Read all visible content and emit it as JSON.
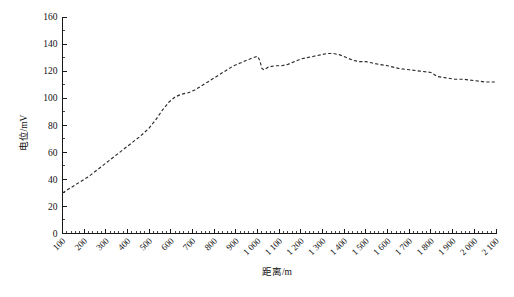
{
  "figure": {
    "background_color": "#ffffff",
    "line_color": "#2b2b2b",
    "axis_color": "#1a1a1a",
    "y_axis_title": "电位/mV",
    "x_axis_title": "距离/m"
  },
  "chart_data": {
    "type": "line",
    "title": "",
    "subtitle": "",
    "xlabel": "距离/m",
    "ylabel": "电位/mV",
    "xlim": [
      100,
      2100
    ],
    "ylim": [
      0,
      160
    ],
    "grid": false,
    "legend": null,
    "legend_position": "none",
    "line_style": "dashed",
    "x_tick_labels": [
      "100",
      "200",
      "300",
      "400",
      "500",
      "600",
      "700",
      "800",
      "900",
      "1 000",
      "1 100",
      "1 200",
      "1 300",
      "1 400",
      "1 500",
      "1 600",
      "1 700",
      "1 800",
      "1 900",
      "2 000",
      "2 100"
    ],
    "x_tick_values": [
      100,
      200,
      300,
      400,
      500,
      600,
      700,
      800,
      900,
      1000,
      1100,
      1200,
      1300,
      1400,
      1500,
      1600,
      1700,
      1800,
      1900,
      2000,
      2100
    ],
    "x_tick_rotation": 45,
    "x_minor_tick_interval": 20,
    "y_tick_labels": [
      "0",
      "20",
      "40",
      "60",
      "80",
      "100",
      "120",
      "140",
      "160"
    ],
    "y_tick_values": [
      0,
      20,
      40,
      60,
      80,
      100,
      120,
      140,
      160
    ],
    "y_minor_tick_interval": 10,
    "series": [
      {
        "name": "电位",
        "x": [
          100,
          140,
          180,
          220,
          260,
          300,
          340,
          380,
          420,
          460,
          500,
          530,
          560,
          590,
          620,
          650,
          680,
          710,
          740,
          770,
          800,
          830,
          860,
          890,
          920,
          950,
          980,
          1000,
          1010,
          1020,
          1030,
          1050,
          1080,
          1110,
          1140,
          1170,
          1200,
          1230,
          1260,
          1290,
          1320,
          1350,
          1380,
          1410,
          1440,
          1470,
          1500,
          1530,
          1560,
          1600,
          1650,
          1700,
          1750,
          1800,
          1830,
          1870,
          1910,
          1950,
          2000,
          2050,
          2100
        ],
        "y": [
          30,
          34,
          38,
          42,
          47,
          52,
          57,
          62,
          67,
          72,
          78,
          84,
          91,
          97,
          101,
          103,
          104,
          106,
          109,
          112,
          115,
          118,
          121,
          124,
          126,
          128,
          130,
          131,
          128,
          122,
          121,
          123,
          124,
          124,
          125,
          127,
          129,
          130,
          131,
          132,
          133,
          133,
          132,
          130,
          128,
          127,
          127,
          126,
          125,
          124,
          122,
          121,
          120,
          119,
          116,
          115,
          114,
          114,
          113,
          112,
          112
        ]
      }
    ]
  }
}
